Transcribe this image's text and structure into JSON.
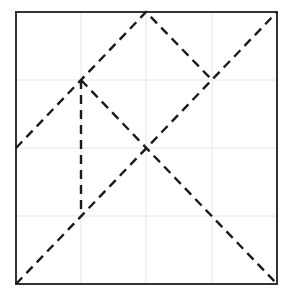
{
  "diagram": {
    "frame": {
      "x0": 16,
      "y0": 12,
      "x1": 277,
      "y1": 284,
      "color": "#333333"
    },
    "grid": {
      "xs": [
        81,
        146,
        212
      ],
      "ys": [
        80,
        148,
        216
      ],
      "color": "#e6e6e6"
    },
    "lines": [
      {
        "id": "diagonal-bottom-left-to-top-right",
        "points": [
          [
            16,
            284
          ],
          [
            277,
            12
          ]
        ]
      },
      {
        "id": "peak-polyline",
        "points": [
          [
            16,
            148
          ],
          [
            146,
            12
          ],
          [
            212,
            80
          ]
        ]
      },
      {
        "id": "diagonal-left-top-to-bottom-right",
        "points": [
          [
            81,
            80
          ],
          [
            277,
            284
          ]
        ]
      },
      {
        "id": "vertical-segment",
        "points": [
          [
            81,
            80
          ],
          [
            81,
            214
          ]
        ]
      }
    ],
    "line_color": "#1a1a1a",
    "dash": "9,6"
  }
}
